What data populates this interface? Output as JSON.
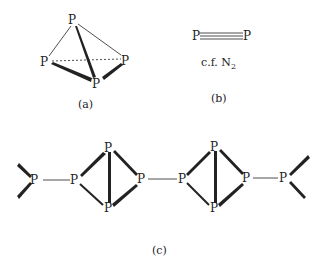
{
  "figure": {
    "panel_a": {
      "label": "(a)",
      "description": "P4 tetrahedron",
      "atoms": [
        {
          "symbol": "P",
          "x": 73,
          "y": 24
        },
        {
          "symbol": "P",
          "x": 46,
          "y": 65
        },
        {
          "symbol": "P",
          "x": 126,
          "y": 64
        },
        {
          "symbol": "P",
          "x": 97,
          "y": 86
        }
      ]
    },
    "panel_b": {
      "label": "(b)",
      "left_atom": "P",
      "right_atom": "P",
      "bond": "triple",
      "note_prefix": "c.f. N",
      "note_subscript": "2"
    },
    "panel_c": {
      "label": "(c)",
      "description": "Polymeric phosphorus chain with butterfly P4 units",
      "atoms": [
        {
          "symbol": "P",
          "x": 36,
          "y": 184
        },
        {
          "symbol": "P",
          "x": 76,
          "y": 184
        },
        {
          "symbol": "P",
          "x": 109,
          "y": 152
        },
        {
          "symbol": "P",
          "x": 109,
          "y": 211
        },
        {
          "symbol": "P",
          "x": 142,
          "y": 183
        },
        {
          "symbol": "P",
          "x": 183,
          "y": 183
        },
        {
          "symbol": "P",
          "x": 215,
          "y": 151
        },
        {
          "symbol": "P",
          "x": 215,
          "y": 211
        },
        {
          "symbol": "P",
          "x": 247,
          "y": 182
        },
        {
          "symbol": "P",
          "x": 284,
          "y": 182
        }
      ]
    }
  }
}
